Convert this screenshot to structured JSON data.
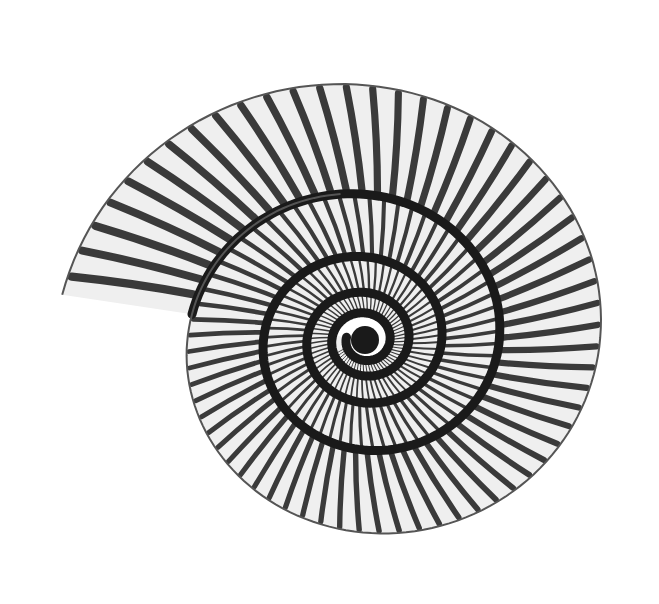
{
  "image": {
    "subject": "ammonite fossil illustration",
    "style": "black and white engraving",
    "background": "#ffffff",
    "ink": "#1a1a1a",
    "highlight": "#f4f4f4",
    "center": [
      365,
      340
    ],
    "whorls": 4,
    "rib_count_outer": 64
  }
}
